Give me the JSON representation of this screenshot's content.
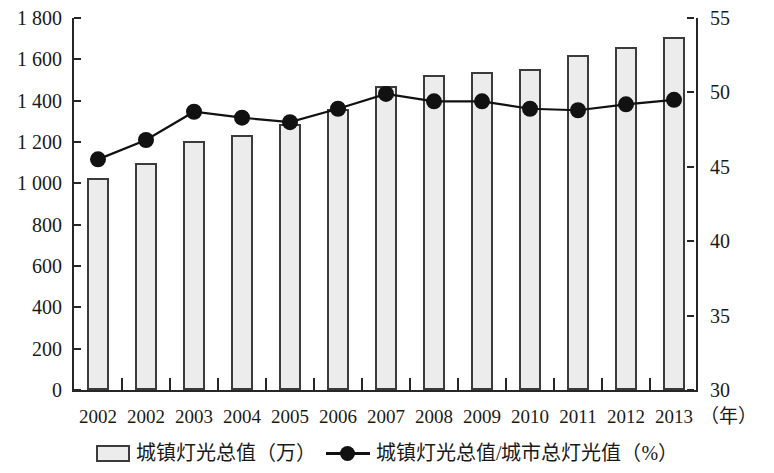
{
  "chart_data": {
    "type": "bar",
    "title": "",
    "subtitle": "",
    "xlabel": "（年）",
    "ylabel": "",
    "categories": [
      "2002",
      "2002",
      "2003",
      "2004",
      "2005",
      "2006",
      "2007",
      "2008",
      "2009",
      "2010",
      "2011",
      "2012",
      "2013"
    ],
    "grid": false,
    "legend_position": "bottom",
    "left_axis": {
      "label": "",
      "ylim": [
        0,
        1800
      ],
      "tick_step": 200,
      "ticks": [
        0,
        200,
        400,
        600,
        800,
        1000,
        1200,
        1400,
        1600,
        1800
      ],
      "tick_labels": [
        "0",
        "200",
        "400",
        "600",
        "800",
        "1 000",
        "1 200",
        "1 400",
        "1 600",
        "1 800"
      ]
    },
    "right_axis": {
      "label": "",
      "ylim": [
        30,
        55
      ],
      "tick_step": 5,
      "ticks": [
        30,
        35,
        40,
        45,
        50,
        55
      ],
      "tick_labels": [
        "30",
        "35",
        "40",
        "45",
        "50",
        "55"
      ]
    },
    "series": [
      {
        "name": "城镇灯光总值（万）",
        "type": "bar",
        "axis": "left",
        "color": "#ececec",
        "edge_color": "#3b3b3b",
        "values": [
          1025,
          1100,
          1205,
          1235,
          1285,
          1360,
          1470,
          1525,
          1540,
          1555,
          1620,
          1660,
          1710
        ]
      },
      {
        "name": "城镇灯光总值/城市总灯光值（%）",
        "type": "line",
        "axis": "right",
        "color": "#111111",
        "marker": "circle",
        "values": [
          45.5,
          46.8,
          48.7,
          48.3,
          48.0,
          48.9,
          49.9,
          49.4,
          49.4,
          48.9,
          48.8,
          49.2,
          49.5
        ]
      }
    ]
  },
  "legend": {
    "entries": [
      {
        "label": "城镇灯光总值（万）",
        "swatch": "bar-swatch"
      },
      {
        "label": "城镇灯光总值/城市总灯光值（%）",
        "swatch": "line-marker-swatch"
      }
    ]
  },
  "axis_unit": {
    "x_unit": "（年）"
  }
}
